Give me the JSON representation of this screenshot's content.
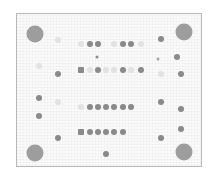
{
  "image": {
    "description": "Dot-blot membrane array with reference spots in four corners",
    "background": "#ffffff",
    "frame_color": "#b9b9b9",
    "colors": {
      "dark": "#8a8a8a",
      "medium": "#a3a3a3",
      "faint": "#e2e2e2",
      "reference": "#9d9d9d"
    }
  },
  "spots": [
    {
      "x": 35,
      "y": 34,
      "d": 17,
      "tone": "reference",
      "shape": "circle"
    },
    {
      "x": 184,
      "y": 32,
      "d": 17,
      "tone": "reference",
      "shape": "circle"
    },
    {
      "x": 35,
      "y": 153,
      "d": 17,
      "tone": "reference",
      "shape": "circle"
    },
    {
      "x": 184,
      "y": 152,
      "d": 17,
      "tone": "reference",
      "shape": "circle"
    },
    {
      "x": 58,
      "y": 40,
      "d": 6,
      "tone": "faint",
      "shape": "circle"
    },
    {
      "x": 81,
      "y": 44,
      "d": 6,
      "tone": "faint",
      "shape": "circle"
    },
    {
      "x": 90,
      "y": 44,
      "d": 6,
      "tone": "dark",
      "shape": "circle"
    },
    {
      "x": 98,
      "y": 44,
      "d": 6,
      "tone": "dark",
      "shape": "circle"
    },
    {
      "x": 114,
      "y": 44,
      "d": 6,
      "tone": "faint",
      "shape": "circle"
    },
    {
      "x": 123,
      "y": 44,
      "d": 6,
      "tone": "dark",
      "shape": "circle"
    },
    {
      "x": 131,
      "y": 44,
      "d": 6,
      "tone": "dark",
      "shape": "circle"
    },
    {
      "x": 141,
      "y": 44,
      "d": 6,
      "tone": "faint",
      "shape": "circle"
    },
    {
      "x": 161,
      "y": 39,
      "d": 6,
      "tone": "dark",
      "shape": "circle"
    },
    {
      "x": 97,
      "y": 57,
      "d": 3,
      "tone": "dark",
      "shape": "circle"
    },
    {
      "x": 158,
      "y": 59,
      "d": 3,
      "tone": "medium",
      "shape": "circle"
    },
    {
      "x": 177,
      "y": 57,
      "d": 6,
      "tone": "dark",
      "shape": "circle"
    },
    {
      "x": 39,
      "y": 66,
      "d": 6,
      "tone": "faint",
      "shape": "circle"
    },
    {
      "x": 58,
      "y": 74,
      "d": 6,
      "tone": "dark",
      "shape": "circle"
    },
    {
      "x": 81,
      "y": 70,
      "d": 6,
      "tone": "dark",
      "shape": "square"
    },
    {
      "x": 90,
      "y": 70,
      "d": 6,
      "tone": "faint",
      "shape": "circle"
    },
    {
      "x": 98,
      "y": 70,
      "d": 6,
      "tone": "dark",
      "shape": "circle"
    },
    {
      "x": 106,
      "y": 70,
      "d": 6,
      "tone": "faint",
      "shape": "circle"
    },
    {
      "x": 114,
      "y": 70,
      "d": 6,
      "tone": "faint",
      "shape": "circle"
    },
    {
      "x": 123,
      "y": 70,
      "d": 6,
      "tone": "dark",
      "shape": "circle"
    },
    {
      "x": 131,
      "y": 70,
      "d": 6,
      "tone": "faint",
      "shape": "circle"
    },
    {
      "x": 141,
      "y": 70,
      "d": 6,
      "tone": "dark",
      "shape": "circle"
    },
    {
      "x": 161,
      "y": 74,
      "d": 6,
      "tone": "faint",
      "shape": "circle"
    },
    {
      "x": 181,
      "y": 74,
      "d": 6,
      "tone": "dark",
      "shape": "circle"
    },
    {
      "x": 39,
      "y": 98,
      "d": 6,
      "tone": "dark",
      "shape": "circle"
    },
    {
      "x": 58,
      "y": 102,
      "d": 6,
      "tone": "faint",
      "shape": "circle"
    },
    {
      "x": 161,
      "y": 102,
      "d": 6,
      "tone": "dark",
      "shape": "circle"
    },
    {
      "x": 181,
      "y": 109,
      "d": 6,
      "tone": "dark",
      "shape": "circle"
    },
    {
      "x": 81,
      "y": 107,
      "d": 6,
      "tone": "faint",
      "shape": "circle"
    },
    {
      "x": 90,
      "y": 107,
      "d": 6,
      "tone": "dark",
      "shape": "circle"
    },
    {
      "x": 98,
      "y": 107,
      "d": 6,
      "tone": "dark",
      "shape": "circle"
    },
    {
      "x": 106,
      "y": 107,
      "d": 6,
      "tone": "dark",
      "shape": "circle"
    },
    {
      "x": 114,
      "y": 107,
      "d": 6,
      "tone": "dark",
      "shape": "circle"
    },
    {
      "x": 123,
      "y": 107,
      "d": 6,
      "tone": "dark",
      "shape": "circle"
    },
    {
      "x": 131,
      "y": 107,
      "d": 6,
      "tone": "dark",
      "shape": "circle"
    },
    {
      "x": 39,
      "y": 116,
      "d": 6,
      "tone": "dark",
      "shape": "circle"
    },
    {
      "x": 58,
      "y": 138,
      "d": 6,
      "tone": "dark",
      "shape": "circle"
    },
    {
      "x": 161,
      "y": 138,
      "d": 6,
      "tone": "dark",
      "shape": "circle"
    },
    {
      "x": 181,
      "y": 129,
      "d": 6,
      "tone": "dark",
      "shape": "circle"
    },
    {
      "x": 81,
      "y": 132,
      "d": 6,
      "tone": "dark",
      "shape": "square"
    },
    {
      "x": 90,
      "y": 132,
      "d": 6,
      "tone": "dark",
      "shape": "circle"
    },
    {
      "x": 98,
      "y": 132,
      "d": 6,
      "tone": "dark",
      "shape": "circle"
    },
    {
      "x": 106,
      "y": 132,
      "d": 6,
      "tone": "dark",
      "shape": "circle"
    },
    {
      "x": 114,
      "y": 132,
      "d": 6,
      "tone": "dark",
      "shape": "circle"
    },
    {
      "x": 123,
      "y": 132,
      "d": 6,
      "tone": "dark",
      "shape": "circle"
    },
    {
      "x": 106,
      "y": 154,
      "d": 6,
      "tone": "dark",
      "shape": "circle"
    }
  ]
}
